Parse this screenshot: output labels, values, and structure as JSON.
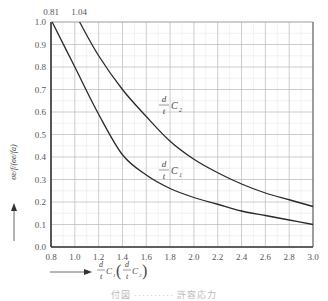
{
  "chart_data": {
    "type": "line",
    "title": "",
    "xlabel": "d/t C1 (d/t C2)",
    "ylabel": "σe/f/(σe/fa)",
    "xlim": [
      0.8,
      3.0
    ],
    "ylim": [
      0.0,
      1.0
    ],
    "grid": true,
    "x_ticks": [
      "0.8",
      "1.0",
      "1.2",
      "1.4",
      "1.6",
      "1.8",
      "2.0",
      "2.2",
      "2.4",
      "2.6",
      "2.8",
      "3.0"
    ],
    "y_ticks": [
      "0.0",
      "0.1",
      "0.2",
      "0.3",
      "0.4",
      "0.5",
      "0.6",
      "0.7",
      "0.8",
      "0.9",
      "1.0"
    ],
    "top_annotations": [
      {
        "text": "0.81",
        "x": 0.81
      },
      {
        "text": "1.04",
        "x": 1.04
      }
    ],
    "series": [
      {
        "name": "d/t C1",
        "x": [
          0.81,
          1.0,
          1.2,
          1.4,
          1.6,
          1.8,
          2.0,
          2.2,
          2.4,
          2.6,
          2.8,
          3.0
        ],
        "y": [
          1.0,
          0.8,
          0.59,
          0.41,
          0.32,
          0.26,
          0.22,
          0.19,
          0.16,
          0.14,
          0.12,
          0.1
        ]
      },
      {
        "name": "d/t C2",
        "x": [
          1.04,
          1.2,
          1.4,
          1.6,
          1.8,
          2.0,
          2.2,
          2.4,
          2.6,
          2.8,
          3.0
        ],
        "y": [
          1.0,
          0.85,
          0.7,
          0.58,
          0.47,
          0.39,
          0.33,
          0.28,
          0.24,
          0.21,
          0.18
        ]
      }
    ]
  },
  "labels": {
    "curve_c1_num": "d",
    "curve_c1_den": "t",
    "curve_c1_sym": "C",
    "curve_c1_sub": "1",
    "curve_c2_num": "d",
    "curve_c2_den": "t",
    "curve_c2_sym": "C",
    "curve_c2_sub": "2",
    "y_axis": "σe/f/(σe/fa)",
    "x_axis_left": "d",
    "x_axis_left_den": "t",
    "x_axis_sym1": "C",
    "x_axis_sub1": "1",
    "x_axis_sym2": "C",
    "x_axis_sub2": "2",
    "annot_081": "0.81",
    "annot_104": "1.04"
  },
  "caption": "付図 ·········· 許容応力"
}
